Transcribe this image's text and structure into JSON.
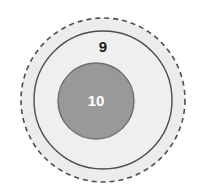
{
  "diagram": {
    "type": "concentric-circles",
    "title": "",
    "background_color": "#ffffff",
    "rings": [
      {
        "name": "outer-dashed-boundary",
        "label": "",
        "fill_color": "#ececec",
        "stroke_color": "#4d4d4d",
        "stroke_style": "dashed",
        "stroke_width": 1.6,
        "dash_pattern": "5 4",
        "center_x": 103,
        "center_y": 100,
        "radius": 82
      },
      {
        "name": "middle-solid-circle",
        "label": "9",
        "fill_color": "#efefef",
        "stroke_color": "#4d4d4d",
        "stroke_style": "solid",
        "stroke_width": 1.4,
        "center_x": 103,
        "center_y": 100,
        "radius": 69
      },
      {
        "name": "inner-gray-circle",
        "label": "10",
        "fill_color": "#999999",
        "stroke_color": "#6e6e6e",
        "stroke_style": "solid",
        "stroke_width": 1.4,
        "center_x": 96,
        "center_y": 101,
        "radius": 38
      }
    ],
    "labels": {
      "outer_ring_label": "9",
      "outer_ring_label_x": 103,
      "outer_ring_label_y": 48,
      "inner_circle_label": "10",
      "inner_circle_label_x": 96,
      "inner_circle_label_y": 102
    }
  }
}
